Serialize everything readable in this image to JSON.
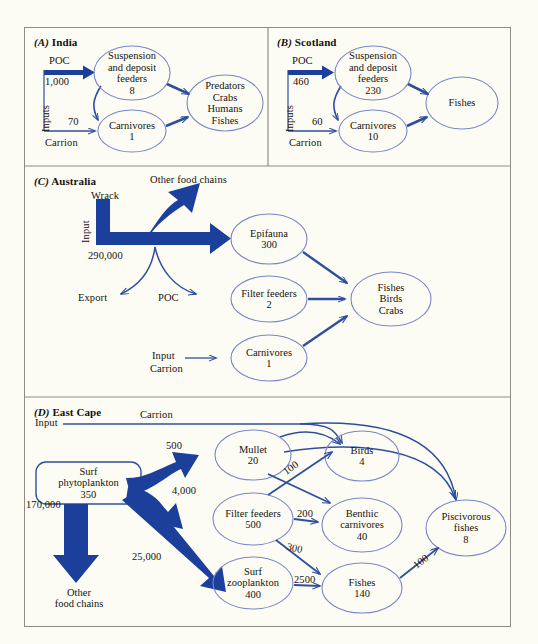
{
  "figure": {
    "background_color": "#fdfcf4",
    "frame_color": "#8d8b86",
    "thick_arrow_color": "#1c3f9c",
    "thin_arrow_color": "#2d4f9e",
    "ellipse_color": "#7a86c8",
    "text_color": "#15120e"
  },
  "panels": [
    {
      "id": "A",
      "letter": "(A)",
      "title": "India",
      "inputs_label": "Inputs",
      "flows": [
        {
          "name": "poc",
          "label": "POC",
          "value": "1,000",
          "style": "thick"
        },
        {
          "name": "carrion",
          "label": "Carrion",
          "value": "70",
          "style": "thin"
        }
      ],
      "nodes": [
        {
          "name": "suspension-deposit-feeders",
          "lines": [
            "Suspension",
            "and deposit",
            "feeders",
            "8"
          ]
        },
        {
          "name": "carnivores",
          "lines": [
            "Carnivores",
            "1"
          ]
        },
        {
          "name": "predators",
          "lines": [
            "Predators",
            "Crabs",
            "Humans",
            "Fishes"
          ]
        }
      ]
    },
    {
      "id": "B",
      "letter": "(B)",
      "title": "Scotland",
      "inputs_label": "Inputs",
      "flows": [
        {
          "name": "poc",
          "label": "POC",
          "value": "460",
          "style": "thick"
        },
        {
          "name": "carrion",
          "label": "Carrion",
          "value": "60",
          "style": "thin"
        }
      ],
      "nodes": [
        {
          "name": "suspension-deposit-feeders",
          "lines": [
            "Suspension",
            "and deposit",
            "feeders",
            "230"
          ]
        },
        {
          "name": "carnivores",
          "lines": [
            "Carnivores",
            "10"
          ]
        },
        {
          "name": "fishes",
          "lines": [
            "Fishes"
          ]
        }
      ]
    },
    {
      "id": "C",
      "letter": "(C)",
      "title": "Australia",
      "input_label": "Input",
      "wrack_label": "Wrack",
      "wrack_value": "290,000",
      "other_food_chains_label": "Other food chains",
      "export_label": "Export",
      "poc_label": "POC",
      "carrion_input_label": "Input",
      "carrion_label": "Carrion",
      "nodes": [
        {
          "name": "epifauna",
          "lines": [
            "Epifauna",
            "300"
          ]
        },
        {
          "name": "filter-feeders",
          "lines": [
            "Filter feeders",
            "2"
          ]
        },
        {
          "name": "carnivores",
          "lines": [
            "Carnivores",
            "1"
          ]
        },
        {
          "name": "fishes-birds-crabs",
          "lines": [
            "Fishes",
            "Birds",
            "Crabs"
          ]
        }
      ]
    },
    {
      "id": "D",
      "letter": "(D)",
      "title": "East Cape",
      "input_label": "Input",
      "carrion_label": "Carrion",
      "other_food_chains_lines": [
        "Other",
        "food chains"
      ],
      "nodes": [
        {
          "name": "surf-phytoplankton",
          "lines": [
            "Surf",
            "phytoplankton",
            "350"
          ]
        },
        {
          "name": "mullet",
          "lines": [
            "Mullet",
            "20"
          ]
        },
        {
          "name": "filter-feeders",
          "lines": [
            "Filter feeders",
            "500"
          ]
        },
        {
          "name": "surf-zooplankton",
          "lines": [
            "Surf",
            "zooplankton",
            "400"
          ]
        },
        {
          "name": "birds",
          "lines": [
            "Birds",
            "4"
          ]
        },
        {
          "name": "benthic-carnivores",
          "lines": [
            "Benthic",
            "carnivores",
            "40"
          ]
        },
        {
          "name": "fishes",
          "lines": [
            "Fishes",
            "140"
          ]
        },
        {
          "name": "piscivorous-fishes",
          "lines": [
            "Piscivorous",
            "fishes",
            "8"
          ]
        }
      ],
      "flow_values": {
        "to_other_food_chains": "170,000",
        "to_mullet": "500",
        "to_filter_feeders": "4,000",
        "to_surf_zooplankton": "25,000",
        "filter_to_birds": "100",
        "filter_to_benthic": "200",
        "filter_to_fishes": "300",
        "zoo_to_fishes": "2500",
        "fishes_to_piscivorous": "100"
      }
    }
  ]
}
